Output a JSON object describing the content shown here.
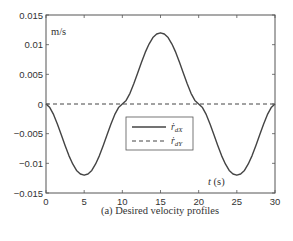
{
  "chart_data": {
    "type": "line",
    "title": "",
    "caption": "(a) Desired velocity profiles",
    "xlabel": "t (s)",
    "ylabel": "m/s",
    "xlim": [
      0,
      30
    ],
    "ylim": [
      -0.015,
      0.015
    ],
    "xticks": [
      0,
      5,
      10,
      15,
      20,
      25,
      30
    ],
    "xtick_labels": [
      "0",
      "5",
      "10",
      "15",
      "20",
      "25",
      "30"
    ],
    "yticks": [
      0.015,
      0.01,
      0.005,
      0,
      -0.005,
      -0.01,
      -0.015
    ],
    "ytick_labels": [
      "0.015",
      "0.01",
      "0.005",
      "0",
      "−0.005",
      "−0.01",
      "−0.015"
    ],
    "grid": false,
    "legend_position": "center-right inside axes",
    "legend": [
      {
        "label": "ṙdX",
        "base": "ṙ",
        "sub": "dX",
        "style": "solid"
      },
      {
        "label": "ṙdY",
        "base": "ṙ",
        "sub": "dY",
        "style": "dashed"
      }
    ],
    "series": [
      {
        "name": "ṙdX",
        "style": "solid",
        "color": "#444444",
        "x": [
          0,
          0.5,
          1,
          1.5,
          2,
          2.5,
          3,
          3.5,
          4,
          4.5,
          5,
          5.5,
          6,
          6.5,
          7,
          7.5,
          8,
          8.5,
          9,
          9.5,
          10,
          10.5,
          11,
          11.5,
          12,
          12.5,
          13,
          13.5,
          14,
          14.5,
          15,
          15.5,
          16,
          16.5,
          17,
          17.5,
          18,
          18.5,
          19,
          19.5,
          20,
          20.5,
          21,
          21.5,
          22,
          22.5,
          23,
          23.5,
          24,
          24.5,
          25,
          25.5,
          26,
          26.5,
          27,
          27.5,
          28,
          28.5,
          29,
          29.5,
          30
        ],
        "values": [
          0,
          -0.0006,
          -0.0018,
          -0.0034,
          -0.0052,
          -0.007,
          -0.0087,
          -0.0101,
          -0.0112,
          -0.0118,
          -0.012,
          -0.0118,
          -0.0112,
          -0.0101,
          -0.0087,
          -0.007,
          -0.0052,
          -0.0034,
          -0.0018,
          -0.0006,
          0,
          0.0006,
          0.0018,
          0.0034,
          0.0052,
          0.007,
          0.0087,
          0.0101,
          0.0112,
          0.0118,
          0.012,
          0.0118,
          0.0112,
          0.0101,
          0.0087,
          0.007,
          0.0052,
          0.0034,
          0.0018,
          0.0006,
          0,
          -0.0006,
          -0.0018,
          -0.0034,
          -0.0052,
          -0.007,
          -0.0087,
          -0.0101,
          -0.0112,
          -0.0118,
          -0.012,
          -0.0118,
          -0.0112,
          -0.0101,
          -0.0087,
          -0.007,
          -0.0052,
          -0.0034,
          -0.0018,
          -0.0006,
          0
        ]
      },
      {
        "name": "ṙdY",
        "style": "dashed",
        "color": "#444444",
        "x": [
          0,
          30
        ],
        "values": [
          0,
          0
        ]
      }
    ]
  }
}
